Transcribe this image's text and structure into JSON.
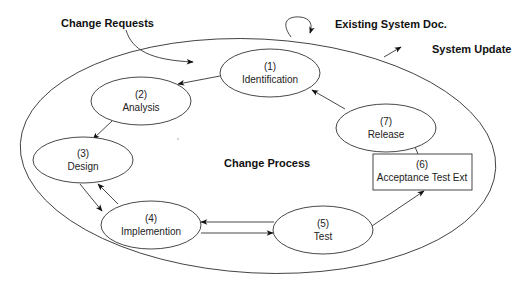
{
  "diagram": {
    "outer_label": "Change Process",
    "external_labels": {
      "change_requests": "Change Requests",
      "existing_doc": "Existing System Doc.",
      "system_update": "System Update"
    },
    "nodes": [
      {
        "id": 1,
        "num": "(1)",
        "label": "Identification",
        "shape": "ellipse"
      },
      {
        "id": 2,
        "num": "(2)",
        "label": "Analysis",
        "shape": "ellipse"
      },
      {
        "id": 3,
        "num": "(3)",
        "label": "Design",
        "shape": "ellipse"
      },
      {
        "id": 4,
        "num": "(4)",
        "label": "Implemention",
        "shape": "ellipse"
      },
      {
        "id": 5,
        "num": "(5)",
        "label": "Test",
        "shape": "ellipse"
      },
      {
        "id": 6,
        "num": "(6)",
        "label": "Acceptance Test Ext",
        "shape": "rectangle"
      },
      {
        "id": 7,
        "num": "(7)",
        "label": "Release",
        "shape": "ellipse"
      }
    ],
    "edges": [
      {
        "from": "Change Requests",
        "to": 1
      },
      {
        "from": 1,
        "to": 2
      },
      {
        "from": 2,
        "to": 3
      },
      {
        "from": 3,
        "to": 4
      },
      {
        "from": 4,
        "to": 3
      },
      {
        "from": 4,
        "to": 5
      },
      {
        "from": 5,
        "to": 4
      },
      {
        "from": 5,
        "to": 6
      },
      {
        "from": 6,
        "to": 7
      },
      {
        "from": 7,
        "to": 1
      },
      {
        "from": "Existing System Doc.",
        "to": "Existing System Doc.",
        "type": "self-loop"
      },
      {
        "from": "Change Process",
        "to": "System Update"
      }
    ]
  }
}
